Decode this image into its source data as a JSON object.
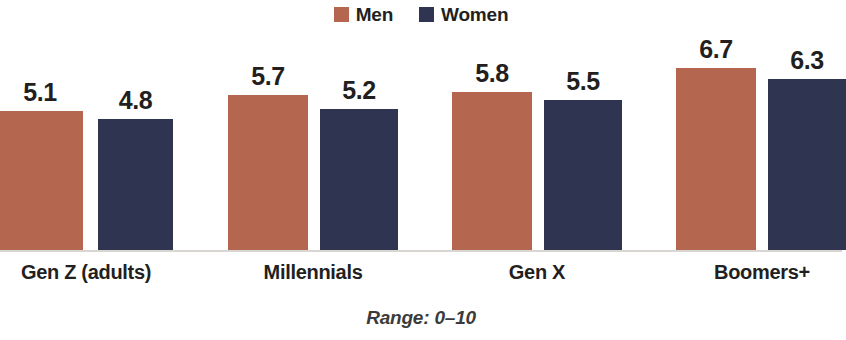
{
  "chart_data": {
    "type": "bar",
    "title": "",
    "subtitle": "",
    "xlabel": "",
    "ylabel": "",
    "ylim": [
      0,
      10
    ],
    "grid": false,
    "legend_position": "top-center",
    "annotation": "Range: 0–10",
    "categories": [
      "Gen Z (adults)",
      "Millennials",
      "Gen X",
      "Boomers+"
    ],
    "series": [
      {
        "name": "Men",
        "color": "#b5664e",
        "values": [
          5.1,
          5.7,
          5.8,
          6.7
        ],
        "labels": [
          "5.1",
          "5.7",
          "5.8",
          "6.7"
        ]
      },
      {
        "name": "Women",
        "color": "#2f3450",
        "values": [
          4.8,
          5.2,
          5.5,
          6.3
        ],
        "labels": [
          "4.8",
          "5.2",
          "5.5",
          "6.3"
        ]
      }
    ]
  },
  "legend": {
    "items": [
      {
        "label": "Men",
        "color": "#b5664e"
      },
      {
        "label": "Women",
        "color": "#2f3450"
      }
    ]
  },
  "footnote": {
    "text": "Range: 0–10"
  },
  "axis": {
    "categories": [
      {
        "label": "Gen Z (adults)"
      },
      {
        "label": "Millennials"
      },
      {
        "label": "Gen X"
      },
      {
        "label": "Boomers+"
      }
    ]
  },
  "bars": [
    {
      "series": "Men",
      "category": "Gen Z (adults)",
      "value": 5.1,
      "label": "5.1",
      "color": "#b5664e",
      "left": -3,
      "width": 86
    },
    {
      "series": "Women",
      "category": "Gen Z (adults)",
      "value": 4.8,
      "label": "4.8",
      "color": "#2f3450",
      "left": 98,
      "width": 75
    },
    {
      "series": "Men",
      "category": "Millennials",
      "value": 5.7,
      "label": "5.7",
      "color": "#b5664e",
      "left": 228,
      "width": 80
    },
    {
      "series": "Women",
      "category": "Millennials",
      "value": 5.2,
      "label": "5.2",
      "color": "#2f3450",
      "left": 320,
      "width": 78
    },
    {
      "series": "Men",
      "category": "Gen X",
      "value": 5.8,
      "label": "5.8",
      "color": "#b5664e",
      "left": 452,
      "width": 80
    },
    {
      "series": "Women",
      "category": "Gen X",
      "value": 5.5,
      "label": "5.5",
      "color": "#2f3450",
      "left": 544,
      "width": 78
    },
    {
      "series": "Men",
      "category": "Boomers+",
      "value": 6.7,
      "label": "6.7",
      "color": "#b5664e",
      "left": 676,
      "width": 80
    },
    {
      "series": "Women",
      "category": "Boomers+",
      "value": 6.3,
      "label": "6.3",
      "color": "#2f3450",
      "left": 768,
      "width": 78
    }
  ],
  "category_positions": [
    {
      "label": "Gen Z (adults)",
      "center": 86
    },
    {
      "label": "Millennials",
      "center": 313
    },
    {
      "label": "Gen X",
      "center": 537
    },
    {
      "label": "Boomers+",
      "center": 762
    }
  ],
  "scale": {
    "baseline_y": 250,
    "px_per_unit": 27.2
  }
}
